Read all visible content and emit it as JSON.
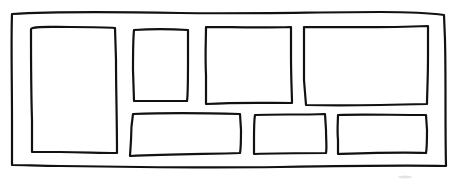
{
  "diagram": {
    "type": "wireframe-layout-sketch",
    "style": "hand-drawn",
    "stroke_color": "#111111",
    "background_color": "#ffffff",
    "outer_frame": {
      "name": "outer-frame",
      "path": "M12,14 C60,11 120,12 180,13 C250,14 320,12 380,12 C410,12 430,13 444,15 L445,40 C446,80 445,120 446,166 C400,165 340,166 280,167 C200,168 120,167 60,166 C40,166 25,165 12,165 L12,120 C12,80 11,40 12,14 Z"
    },
    "panels": [
      {
        "name": "panel-tall-left",
        "path": "M31,29 C33,26 50,27 70,27 C90,27 105,27 115,28 L116,60 C116,90 117,120 117,153 C100,153 80,152 60,152 C45,152 35,152 32,152 L32,120 C31,90 31,60 31,29 Z"
      },
      {
        "name": "panel-small-top",
        "path": "M134,30 C150,29 170,29 188,30 L188,60 C188,80 188,95 187,101 C170,101 150,101 134,101 L133,70 C133,55 133,40 134,30 Z"
      },
      {
        "name": "panel-medium-top",
        "path": "M206,27 C230,27 260,28 291,27 L291,55 C291,80 292,95 292,103 C270,103 240,102 206,104 L206,75 C205,55 206,40 206,27 Z"
      },
      {
        "name": "panel-wide-top-right",
        "path": "M304,27 C340,27 380,28 428,26 L428,55 C428,80 427,95 427,104 C390,105 350,106 306,105 L304,80 C304,60 304,45 304,27 Z"
      },
      {
        "name": "panel-wide-bottom-left",
        "path": "M133,114 C160,113 200,113 240,114 L241,130 C241,140 241,148 240,153 C210,154 170,154 130,156 L131,140 C131,130 132,120 133,114 Z"
      },
      {
        "name": "panel-bottom-middle",
        "path": "M255,115 C275,114 300,115 325,114 L326,130 C326,140 327,148 326,153 C300,153 280,153 254,154 L254,140 C254,130 254,120 255,115 Z"
      },
      {
        "name": "panel-bottom-right",
        "path": "M338,115 C360,114 390,115 426,115 L427,130 C427,140 427,148 426,153 C400,152 370,153 338,154 L338,140 C337,130 338,120 338,115 Z"
      }
    ]
  }
}
